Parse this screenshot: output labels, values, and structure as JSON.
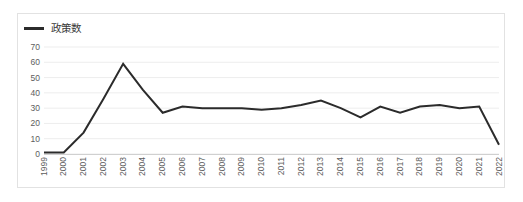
{
  "legend": {
    "label": "政策数",
    "color": "#2b2b2b",
    "marker": "line-swatch-icon"
  },
  "chart_data": {
    "type": "line",
    "title": "",
    "subtitle": "",
    "xlabel": "",
    "ylabel": "",
    "categories": [
      "1999",
      "2000",
      "2001",
      "2002",
      "2003",
      "2004",
      "2005",
      "2006",
      "2007",
      "2008",
      "2009",
      "2010",
      "2011",
      "2012",
      "2013",
      "2014",
      "2015",
      "2016",
      "2017",
      "2018",
      "2019",
      "2020",
      "2021",
      "2022"
    ],
    "series": [
      {
        "name": "政策数",
        "color": "#2b2b2b",
        "values": [
          1,
          1,
          14,
          36,
          59,
          42,
          27,
          31,
          30,
          30,
          30,
          29,
          30,
          32,
          35,
          30,
          24,
          31,
          27,
          31,
          32,
          30,
          31,
          6
        ]
      }
    ],
    "ylim": [
      0,
      70
    ],
    "yticks": [
      0,
      10,
      20,
      30,
      40,
      50,
      60,
      70
    ],
    "ytick_labels": [
      "0",
      "10",
      "20",
      "30",
      "40",
      "50",
      "60",
      "70"
    ],
    "grid": true,
    "grid_color": "#ededed",
    "legend_position": "top-left",
    "line_width": 2
  }
}
